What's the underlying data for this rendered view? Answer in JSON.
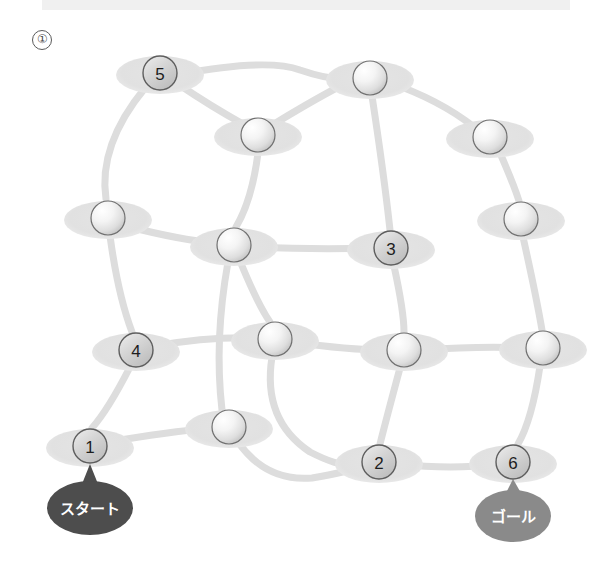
{
  "page": {
    "item_marker": "①",
    "background_color": "#ffffff",
    "top_bar_color": "#f0f0f0"
  },
  "colors": {
    "edge": "#dddddd",
    "platform": "#e2e2e2",
    "node_numbered_fill": "#c9c9c9",
    "node_numbered_stroke": "#5e5e5e",
    "node_plain_stroke": "#707070",
    "start_ellipse": "#4d4d4d",
    "goal_ellipse": "#8a8a8a",
    "label_text": "#ffffff",
    "number_text": "#1d1d1d"
  },
  "diagram": {
    "type": "network-graph",
    "title": "",
    "width": 612,
    "height": 568,
    "node_radius": 17,
    "platform_rx": 44,
    "platform_ry": 19,
    "edge_width": 7,
    "nodes": [
      {
        "id": "n5",
        "label": "5",
        "numbered": true,
        "x": 160,
        "y": 73
      },
      {
        "id": "t1",
        "label": "",
        "numbered": false,
        "x": 370,
        "y": 78
      },
      {
        "id": "t2",
        "label": "",
        "numbered": false,
        "x": 258,
        "y": 135
      },
      {
        "id": "t3",
        "label": "",
        "numbered": false,
        "x": 490,
        "y": 137
      },
      {
        "id": "m1",
        "label": "",
        "numbered": false,
        "x": 108,
        "y": 218
      },
      {
        "id": "m2",
        "label": "",
        "numbered": false,
        "x": 234,
        "y": 245
      },
      {
        "id": "n3",
        "label": "3",
        "numbered": true,
        "x": 391,
        "y": 248
      },
      {
        "id": "m3",
        "label": "",
        "numbered": false,
        "x": 521,
        "y": 219
      },
      {
        "id": "n4",
        "label": "4",
        "numbered": true,
        "x": 136,
        "y": 350
      },
      {
        "id": "b1",
        "label": "",
        "numbered": false,
        "x": 275,
        "y": 339
      },
      {
        "id": "b2",
        "label": "",
        "numbered": false,
        "x": 404,
        "y": 350
      },
      {
        "id": "b3",
        "label": "",
        "numbered": false,
        "x": 543,
        "y": 348
      },
      {
        "id": "n1",
        "label": "1",
        "numbered": true,
        "x": 90,
        "y": 446
      },
      {
        "id": "b4",
        "label": "",
        "numbered": false,
        "x": 229,
        "y": 427
      },
      {
        "id": "n2",
        "label": "2",
        "numbered": true,
        "x": 379,
        "y": 462
      },
      {
        "id": "n6",
        "label": "6",
        "numbered": true,
        "x": 513,
        "y": 462
      }
    ],
    "edges": [
      {
        "from": "n5",
        "to": "t2",
        "path": "M 178 84 Q 212 107 243 124"
      },
      {
        "from": "n5",
        "to": "m1",
        "path": "M 145 88 Q 98 145 106 199"
      },
      {
        "from": "n5",
        "to": "t1",
        "path": "M 180 74 Q 268 58 300 70 Q 335 82 354 78"
      },
      {
        "from": "t2",
        "to": "m2",
        "path": "M 258 153 Q 252 200 236 227"
      },
      {
        "from": "t1",
        "to": "t3",
        "path": "M 388 82 Q 440 100 474 127"
      },
      {
        "from": "t1",
        "to": "n3",
        "path": "M 372 96 Q 384 175 390 230"
      },
      {
        "from": "t1",
        "to": "t2",
        "path": "M 352 80 Q 320 96 274 124"
      },
      {
        "from": "t3",
        "to": "m3",
        "path": "M 500 153 Q 514 185 519 201"
      },
      {
        "from": "m1",
        "to": "m2",
        "path": "M 126 226 Q 180 240 216 243"
      },
      {
        "from": "m1",
        "to": "n4",
        "path": "M 110 236 Q 118 295 132 332"
      },
      {
        "from": "m2",
        "to": "n3",
        "path": "M 252 247 Q 320 250 373 248"
      },
      {
        "from": "m2",
        "to": "b1",
        "path": "M 240 261 Q 258 305 270 322"
      },
      {
        "from": "n3",
        "to": "b2",
        "path": "M 394 266 Q 404 312 404 332"
      },
      {
        "from": "m3",
        "to": "b3",
        "path": "M 523 237 Q 536 295 542 330"
      },
      {
        "from": "n4",
        "to": "b1",
        "path": "M 154 346 Q 212 336 257 338"
      },
      {
        "from": "n4",
        "to": "n1",
        "path": "M 130 367 Q 108 410 92 428"
      },
      {
        "from": "b1",
        "to": "b2",
        "path": "M 293 342 Q 348 350 386 350"
      },
      {
        "from": "b1",
        "to": "n2",
        "path": "M 272 357 Q 262 420 310 452 Q 345 470 361 464"
      },
      {
        "from": "b2",
        "to": "b3",
        "path": "M 422 350 Q 480 346 525 348"
      },
      {
        "from": "b2",
        "to": "n2",
        "path": "M 400 368 Q 386 420 380 444"
      },
      {
        "from": "b3",
        "to": "n6",
        "path": "M 540 366 Q 532 420 518 444"
      },
      {
        "from": "n1",
        "to": "b4",
        "path": "M 108 442 Q 168 432 211 428"
      },
      {
        "from": "b4",
        "to": "n2",
        "path": "M 238 442 Q 266 482 312 478 Q 348 472 361 466"
      },
      {
        "from": "n2",
        "to": "n6",
        "path": "M 397 464 Q 455 470 495 464"
      },
      {
        "from": "m2",
        "to": "b4",
        "path": "M 228 262 Q 214 340 222 410"
      }
    ],
    "endpoints": [
      {
        "id": "start",
        "text": "スタート",
        "attached_to": "n1",
        "cx": 90,
        "cy": 508,
        "rx": 43,
        "ry": 27,
        "fill": "#4d4d4d",
        "pointer": "M 82 484 L 98 484 L 90 464 Z"
      },
      {
        "id": "goal",
        "text": "ゴール",
        "attached_to": "n6",
        "cx": 513,
        "cy": 516,
        "rx": 38,
        "ry": 26,
        "fill": "#8a8a8a",
        "pointer": "M 506 493 L 521 493 L 513 479 Z"
      }
    ]
  }
}
